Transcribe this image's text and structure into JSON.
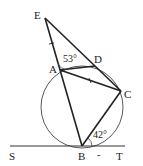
{
  "diagram": {
    "type": "geometry",
    "points": {
      "E": {
        "label": "E",
        "x": 45,
        "y": 18
      },
      "A": {
        "label": "A",
        "x": 60,
        "y": 70
      },
      "D": {
        "label": "D",
        "x": 95,
        "y": 66
      },
      "C": {
        "label": "C",
        "x": 121,
        "y": 91
      },
      "B": {
        "label": "B",
        "x": 82,
        "y": 146
      },
      "S": {
        "label": "S",
        "x": 10,
        "y": 146
      },
      "T": {
        "label": "T",
        "x": 125,
        "y": 146
      }
    },
    "circle": {
      "cx": 82,
      "cy": 107,
      "r": 41
    },
    "segments": [
      [
        "E",
        "B"
      ],
      [
        "E",
        "C"
      ],
      [
        "A",
        "D"
      ],
      [
        "A",
        "C"
      ],
      [
        "C",
        "B"
      ],
      [
        "S",
        "T"
      ]
    ],
    "angles": [
      {
        "label": "53°",
        "at": "A",
        "between": "AE-AD"
      },
      {
        "label": "42°",
        "at": "B",
        "between": "BC-BT"
      }
    ],
    "tick_marks": [
      {
        "segment": "EA",
        "count": 1
      },
      {
        "segment": "AC",
        "count": 1
      }
    ],
    "minus_mark": "-",
    "labels": {
      "E": "E",
      "A": "A",
      "D": "D",
      "C": "C",
      "B": "B",
      "S": "S",
      "T": "T",
      "angle_A": "53°",
      "angle_B": "42°"
    }
  }
}
